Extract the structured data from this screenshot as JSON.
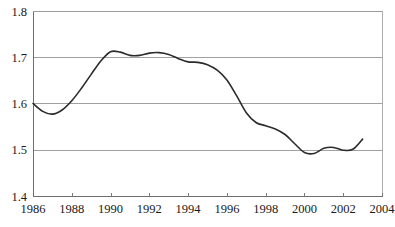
{
  "chart_data": {
    "type": "line",
    "title": "",
    "subtitle": "",
    "xlabel": "",
    "ylabel": "",
    "xlim": [
      1986,
      2004
    ],
    "ylim": [
      1.4,
      1.8
    ],
    "grid": true,
    "legend": null,
    "legend_position": "none",
    "line_color": "#2b2b2b",
    "grid_color": "#8a8a8a",
    "yticks": [
      "1.4",
      "1.5",
      "1.6",
      "1.7",
      "1.8"
    ],
    "ytick_values": [
      1.4,
      1.5,
      1.6,
      1.7,
      1.8
    ],
    "xticks": [
      "1986",
      "1988",
      "1990",
      "1992",
      "1994",
      "1996",
      "1998",
      "2000",
      "2002",
      "2004"
    ],
    "xtick_values": [
      1986,
      1988,
      1990,
      1992,
      1994,
      1996,
      1998,
      2000,
      2002,
      2004
    ],
    "series": [
      {
        "name": "series-1",
        "x": [
          1986.0,
          1986.5,
          1987.0,
          1987.5,
          1988.0,
          1988.5,
          1989.0,
          1989.5,
          1990.0,
          1990.5,
          1991.0,
          1991.5,
          1992.0,
          1992.5,
          1993.0,
          1993.5,
          1994.0,
          1994.5,
          1995.0,
          1995.5,
          1996.0,
          1996.5,
          1997.0,
          1997.5,
          1998.0,
          1998.5,
          1999.0,
          1999.5,
          2000.0,
          2000.5,
          2001.0,
          2001.5,
          2002.0,
          2002.5,
          2003.0
        ],
        "values": [
          1.6,
          1.583,
          1.577,
          1.586,
          1.606,
          1.633,
          1.663,
          1.692,
          1.712,
          1.711,
          1.704,
          1.704,
          1.709,
          1.71,
          1.706,
          1.697,
          1.69,
          1.689,
          1.684,
          1.672,
          1.651,
          1.617,
          1.58,
          1.559,
          1.552,
          1.545,
          1.533,
          1.513,
          1.494,
          1.492,
          1.503,
          1.505,
          1.499,
          1.501,
          1.523
        ]
      }
    ]
  },
  "axes": {
    "plot_left_px": 33,
    "plot_right_px": 382,
    "plot_top_px": 11,
    "plot_bottom_px": 196
  }
}
